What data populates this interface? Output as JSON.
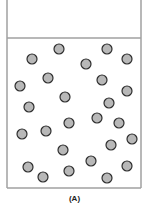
{
  "figure": {
    "label": "(A)",
    "container": {
      "left": 7,
      "right": 141,
      "top": 0,
      "bottom": 188,
      "divider_y": 38,
      "stroke": "#a0a0a0"
    },
    "particle_style": {
      "radius": 5,
      "fill": "#b8b8b8",
      "stroke": "#2e2e2e"
    },
    "particles": [
      [
        59,
        49
      ],
      [
        107,
        49
      ],
      [
        32,
        59
      ],
      [
        127,
        59
      ],
      [
        86,
        64
      ],
      [
        48,
        78
      ],
      [
        102,
        80
      ],
      [
        20,
        86
      ],
      [
        127,
        91
      ],
      [
        65,
        97
      ],
      [
        29,
        107
      ],
      [
        109,
        103
      ],
      [
        97,
        118
      ],
      [
        69,
        123
      ],
      [
        119,
        123
      ],
      [
        22,
        134
      ],
      [
        46,
        131
      ],
      [
        132,
        139
      ],
      [
        111,
        145
      ],
      [
        63,
        150
      ],
      [
        91,
        161
      ],
      [
        127,
        166
      ],
      [
        28,
        167
      ],
      [
        69,
        171
      ],
      [
        43,
        177
      ],
      [
        107,
        178
      ]
    ]
  }
}
